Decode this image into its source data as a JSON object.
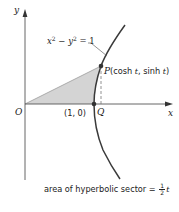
{
  "figure": {
    "type": "hyperbola-sector-diagram",
    "axes": {
      "x_label": "x",
      "y_label": "y",
      "origin_label": "O"
    },
    "curve": {
      "equation_lhs_var1": "x",
      "equation_lhs_var2": "y",
      "exp": "2",
      "minus": " − ",
      "equals": " = 1",
      "color": "#3a3a3a"
    },
    "points": {
      "vertex_label": "(1, 0)",
      "P_label": "P",
      "P_coords_open": "(cosh ",
      "P_t1": "t",
      "P_coords_mid": ", sinh ",
      "P_t2": "t",
      "P_coords_close": ")",
      "Q_label": "Q"
    },
    "sector": {
      "fill_color": "#d4d4d4",
      "caption_text": "area of hyperbolic sector = ",
      "frac_num": "1",
      "frac_den": "2",
      "caption_var": "t"
    }
  }
}
